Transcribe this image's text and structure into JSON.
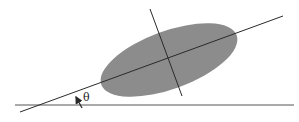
{
  "diagram": {
    "angle_label": "θ",
    "colors": {
      "ellipse_fill": "#8c8c8c",
      "line": "#2a2a2a",
      "background": "#ffffff"
    },
    "elements": {
      "ellipse": {
        "cx": 169,
        "cy": 60,
        "rx": 72,
        "ry": 29,
        "rotation_deg": -20
      },
      "major_axis": {
        "x1": 20,
        "y1": 112,
        "x2": 283,
        "y2": 16
      },
      "minor_axis": {
        "x1": 150,
        "y1": 9,
        "x2": 182,
        "y2": 96
      },
      "baseline": {
        "x1": 15,
        "y1": 105,
        "x2": 294,
        "y2": 105
      },
      "angle_arrow": {
        "x1": 82,
        "y1": 108,
        "x2": 75,
        "y2": 96
      },
      "angle_label_pos": {
        "x": 81,
        "y": 101
      }
    }
  }
}
